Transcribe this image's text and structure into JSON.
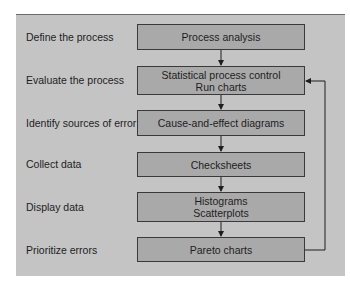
{
  "diagram": {
    "type": "flowchart",
    "background_color": "#c4c4c4",
    "box_color": "#a9a9a9",
    "steps": [
      {
        "label": "Define the process",
        "tools": [
          "Process analysis"
        ]
      },
      {
        "label": "Evaluate the process",
        "tools": [
          "Statistical process control",
          "Run charts"
        ]
      },
      {
        "label": "Identify sources of error",
        "tools": [
          "Cause-and-effect diagrams"
        ]
      },
      {
        "label": "Collect data",
        "tools": [
          "Checksheets"
        ]
      },
      {
        "label": "Display data",
        "tools": [
          "Histograms",
          "Scatterplots"
        ]
      },
      {
        "label": "Prioritize errors",
        "tools": [
          "Pareto charts"
        ]
      }
    ],
    "feedback_loop": {
      "from": "Pareto charts",
      "to": "Statistical process control / Run charts"
    }
  }
}
